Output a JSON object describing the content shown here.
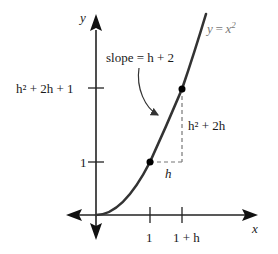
{
  "diagram": {
    "axes": {
      "x_label": "x",
      "y_label": "y",
      "x_ticks": [
        "1",
        "1 + h"
      ],
      "y_ticks": [
        "1",
        "h² + 2h + 1"
      ]
    },
    "curve_label": {
      "lhs": "y",
      "eq": "=",
      "rhs_base": "x",
      "rhs_exp": "2"
    },
    "annotations": {
      "slope_label": "slope = h + 2",
      "run_label": "h",
      "rise_label": "h² + 2h"
    },
    "points": [
      {
        "x": "1",
        "y": "1"
      },
      {
        "x": "1 + h",
        "y": "h² + 2h + 1"
      }
    ],
    "colors": {
      "axes": "#222222",
      "curve": "#333333",
      "dashed": "#777777",
      "curve_label": "#777777"
    }
  }
}
